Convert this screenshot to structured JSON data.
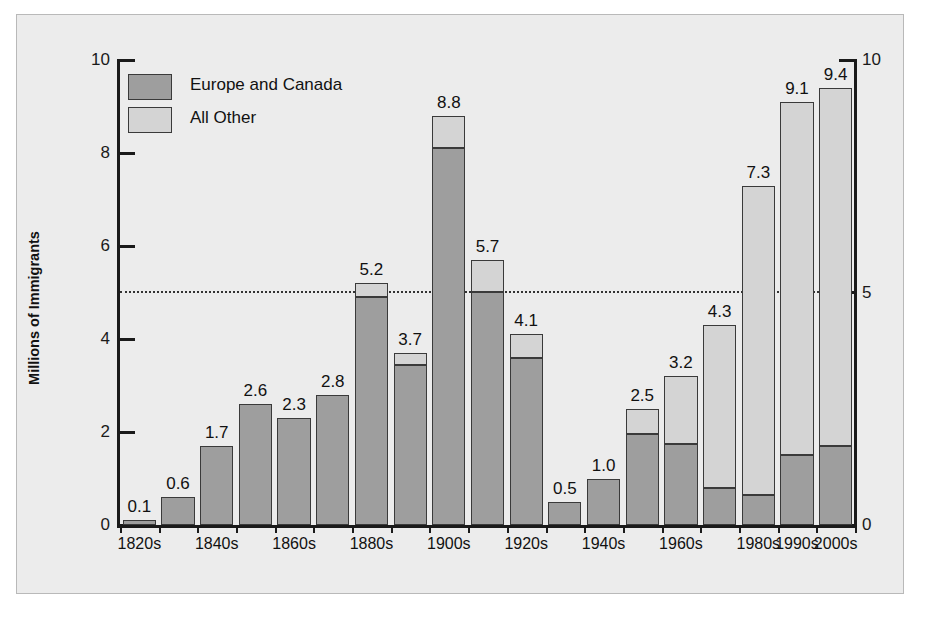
{
  "chart_data": {
    "type": "bar",
    "title": "",
    "subtitle": "",
    "xlabel": "",
    "ylabel": "Millions of Immigrants",
    "ylabel_right": "",
    "ylim": [
      0,
      10
    ],
    "yticks": [
      "0",
      "2",
      "4",
      "6",
      "8",
      "10"
    ],
    "ytick_values": [
      0,
      2,
      4,
      6,
      8,
      10
    ],
    "yticks_right": [
      "0",
      "5",
      "10"
    ],
    "ytick_values_right": [
      0,
      5,
      10
    ],
    "grid": false,
    "reference_line": 5,
    "legend_position": "upper-left-inside",
    "stacked": true,
    "categories": [
      "1820s",
      "1830s",
      "1840s",
      "1850s",
      "1860s",
      "1870s",
      "1880s",
      "1890s",
      "1900s",
      "1910s",
      "1920s",
      "1930s",
      "1940s",
      "1950s",
      "1960s",
      "1970s",
      "1980s",
      "1990s",
      "2000s"
    ],
    "visible_tick_labels": [
      "1820s",
      "1840s",
      "1860s",
      "1880s",
      "1900s",
      "1920s",
      "1940s",
      "1960s",
      "1980s",
      "1990s",
      "2000s"
    ],
    "series": [
      {
        "name": "Europe and Canada",
        "color": "#9e9e9e",
        "values": [
          0.1,
          0.6,
          1.7,
          2.6,
          2.3,
          2.8,
          4.9,
          3.45,
          8.1,
          5.0,
          3.6,
          0.5,
          1.0,
          1.95,
          1.75,
          0.8,
          0.65,
          1.5,
          1.7
        ]
      },
      {
        "name": "All Other",
        "color": "#d4d4d4",
        "values": [
          0.0,
          0.0,
          0.0,
          0.0,
          0.0,
          0.0,
          0.3,
          0.25,
          0.7,
          0.7,
          0.5,
          0.0,
          0.0,
          0.55,
          1.45,
          3.5,
          6.65,
          7.6,
          7.7
        ]
      }
    ],
    "totals": [
      0.1,
      0.6,
      1.7,
      2.6,
      2.3,
      2.8,
      5.2,
      3.7,
      8.8,
      5.7,
      4.1,
      0.5,
      1.0,
      2.5,
      3.2,
      4.3,
      7.3,
      9.1,
      9.4
    ],
    "data_labels": [
      "0.1",
      "0.6",
      "1.7",
      "2.6",
      "2.3",
      "2.8",
      "5.2",
      "3.7",
      "8.8",
      "5.7",
      "4.1",
      "0.5",
      "1.0",
      "2.5",
      "3.2",
      "4.3",
      "7.3",
      "9.1",
      "9.4"
    ]
  },
  "legend": {
    "items": [
      {
        "label": "Europe and Canada",
        "color": "#9e9e9e"
      },
      {
        "label": "All Other",
        "color": "#d4d4d4"
      }
    ]
  },
  "colors": {
    "europe_canada": "#9e9e9e",
    "all_other": "#d4d4d4",
    "bar_outline": "#3a3a3a",
    "axis": "#1a1a1a",
    "plot_background": "#ececec",
    "page_background": "#ffffff"
  }
}
